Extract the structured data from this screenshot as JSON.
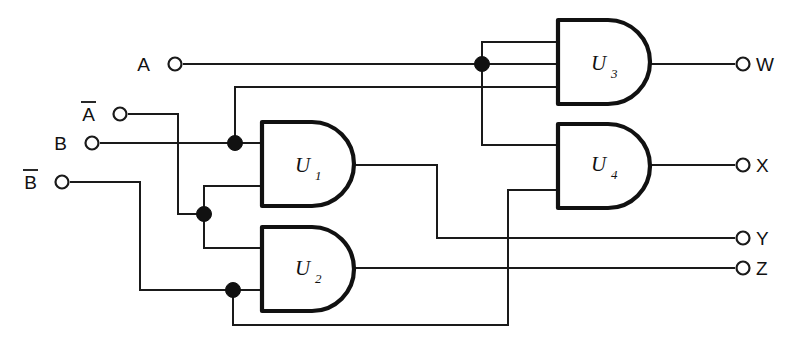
{
  "diagram": {
    "type": "logic-circuit-schematic",
    "background_color": "#ffffff",
    "wire_color": "#1a1a1a",
    "gate_outline_color": "#111111",
    "width": 805,
    "height": 354
  },
  "inputs": [
    {
      "id": "A",
      "label": "A",
      "overbar": false,
      "terminal_x": 175,
      "terminal_y": 64,
      "label_x": 150,
      "label_y": 71
    },
    {
      "id": "Ab",
      "label": "A",
      "overbar": true,
      "terminal_x": 120,
      "terminal_y": 114,
      "label_x": 95,
      "label_y": 121
    },
    {
      "id": "B",
      "label": "B",
      "overbar": false,
      "terminal_x": 92,
      "terminal_y": 143,
      "label_x": 67,
      "label_y": 150
    },
    {
      "id": "Bb",
      "label": "B",
      "overbar": true,
      "terminal_x": 62,
      "terminal_y": 182,
      "label_x": 37,
      "label_y": 189
    }
  ],
  "outputs": [
    {
      "id": "W",
      "label": "W",
      "terminal_x": 743,
      "terminal_y": 64,
      "label_x": 756,
      "label_y": 71,
      "source": "U3"
    },
    {
      "id": "X",
      "label": "X",
      "terminal_x": 743,
      "terminal_y": 165,
      "label_x": 756,
      "label_y": 172,
      "source": "U4"
    },
    {
      "id": "Y",
      "label": "Y",
      "terminal_x": 743,
      "terminal_y": 238,
      "label_x": 756,
      "label_y": 245,
      "source": "U1"
    },
    {
      "id": "Z",
      "label": "Z",
      "terminal_x": 743,
      "terminal_y": 268,
      "label_x": 756,
      "label_y": 275,
      "source": "U2"
    }
  ],
  "gates": [
    {
      "id": "U1",
      "label": "U",
      "subscript": "1",
      "kind": "AND",
      "x": 262,
      "y": 122,
      "width": 92,
      "height": 84,
      "input_ys": [
        143,
        186
      ],
      "output_y": 165,
      "label_x": 295,
      "label_y": 172,
      "sub_x": 315,
      "sub_y": 180
    },
    {
      "id": "U2",
      "label": "U",
      "subscript": "2",
      "kind": "AND",
      "x": 262,
      "y": 227,
      "width": 92,
      "height": 84,
      "input_ys": [
        248,
        290
      ],
      "output_y": 268,
      "label_x": 295,
      "label_y": 275,
      "sub_x": 315,
      "sub_y": 283
    },
    {
      "id": "U3",
      "label": "U",
      "subscript": "3",
      "kind": "AND",
      "x": 558,
      "y": 20,
      "width": 92,
      "height": 84,
      "input_ys": [
        42,
        87
      ],
      "output_y": 64,
      "label_x": 591,
      "label_y": 70,
      "sub_x": 611,
      "sub_y": 78
    },
    {
      "id": "U4",
      "label": "U",
      "subscript": "4",
      "kind": "AND",
      "x": 558,
      "y": 124,
      "width": 92,
      "height": 84,
      "input_ys": [
        145,
        190
      ],
      "output_y": 165,
      "label_x": 591,
      "label_y": 171,
      "sub_x": 611,
      "sub_y": 179
    }
  ],
  "junctions": [
    {
      "id": "j-B",
      "x": 235,
      "y": 143,
      "r": 7.5,
      "on_net": "B"
    },
    {
      "id": "j-Ab",
      "x": 204,
      "y": 214,
      "r": 7.5,
      "on_net": "Ab"
    },
    {
      "id": "j-Bb",
      "x": 233,
      "y": 290,
      "r": 7.5,
      "on_net": "Bb"
    },
    {
      "id": "j-A",
      "x": 482,
      "y": 64,
      "r": 7.5,
      "on_net": "A"
    }
  ],
  "wires": [
    {
      "id": "w-A-main",
      "net": "A",
      "d": "M 184 64 L 482 64 L 558 64",
      "note": "A terminal to junction, continues toward U3 area"
    },
    {
      "id": "w-A-up-U3",
      "net": "A",
      "d": "M 482 64 L 482 42 L 558 42",
      "note": "A junction up to U3 upper input"
    },
    {
      "id": "w-A-down-U4",
      "net": "A",
      "d": "M 482 64 L 482 145 L 558 145",
      "note": "A junction down to U4 upper input"
    },
    {
      "id": "w-B-main",
      "net": "B",
      "d": "M 101 143 L 235 143 L 262 143",
      "note": "B terminal to junction to U1 upper input"
    },
    {
      "id": "w-B-up-U3",
      "net": "B",
      "d": "M 235 143 L 235 87 L 558 87",
      "note": "B junction up and right to U3 lower input"
    },
    {
      "id": "w-Ab-main",
      "net": "Ab",
      "d": "M 129 114 L 178 114 L 178 214 L 204 214",
      "note": "A-bar terminal right then down to junction"
    },
    {
      "id": "w-Ab-U1",
      "net": "Ab",
      "d": "M 204 214 L 204 186 L 262 186",
      "note": "A-bar junction up to U1 lower input"
    },
    {
      "id": "w-Ab-U2",
      "net": "Ab",
      "d": "M 204 214 L 204 248 L 262 248",
      "note": "A-bar junction down to U2 upper input"
    },
    {
      "id": "w-Bb-main",
      "net": "Bb",
      "d": "M 71 182 L 140 182 L 140 290 L 233 290 L 262 290",
      "note": "B-bar terminal right, down, right to junction and U2 lower input"
    },
    {
      "id": "w-Bb-U4",
      "net": "Bb",
      "d": "M 233 290 L 233 325 L 508 325 L 508 190 L 558 190",
      "note": "B-bar junction down, right, up to U4 lower input"
    },
    {
      "id": "w-U3-W",
      "net": "W",
      "d": "M 650 64 L 734 64",
      "note": "U3 output to W terminal"
    },
    {
      "id": "w-U4-X",
      "net": "X",
      "d": "M 650 165 L 734 165",
      "note": "U4 output to X terminal"
    },
    {
      "id": "w-U1-Y",
      "net": "Y",
      "d": "M 354 165 L 437 165 L 437 238 L 734 238",
      "note": "U1 output right, down, right to Y terminal"
    },
    {
      "id": "w-U2-Z",
      "net": "Z",
      "d": "M 354 268 L 734 268",
      "note": "U2 output straight right to Z terminal"
    }
  ],
  "terminal_radius": 6.5
}
